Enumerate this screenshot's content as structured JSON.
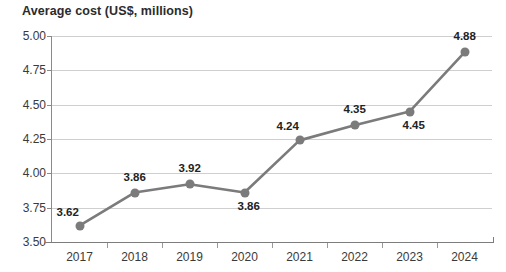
{
  "chart_data": {
    "type": "line",
    "title": "Average cost (US$, millions)",
    "xlabel": "",
    "ylabel": "",
    "categories": [
      "2017",
      "2018",
      "2019",
      "2020",
      "2021",
      "2022",
      "2023",
      "2024"
    ],
    "values": [
      3.62,
      3.86,
      3.92,
      3.86,
      4.24,
      4.35,
      4.45,
      4.88
    ],
    "point_labels": [
      "3.62",
      "3.86",
      "3.92",
      "3.86",
      "4.24",
      "4.35",
      "4.45",
      "4.88"
    ],
    "ylim": [
      3.5,
      5.0
    ],
    "ytick_labels": [
      "5.00",
      "4.75",
      "4.50",
      "4.25",
      "4.00",
      "3.75",
      "3.50"
    ],
    "ytick_values": [
      5.0,
      4.75,
      4.5,
      4.25,
      4.0,
      3.75,
      3.5
    ],
    "grid": true,
    "legend": "none",
    "series": [
      {
        "name": "Average cost (US$, millions)",
        "values": [
          3.62,
          3.86,
          3.92,
          3.86,
          4.24,
          4.35,
          4.45,
          4.88
        ],
        "color": "#7b7b7b"
      }
    ],
    "colors": {
      "line": "#7b7b7b",
      "marker": "#7b7b7b",
      "grid": "#cfcfcf",
      "axis": "#8a8a8a",
      "text": "#2b2b2b"
    },
    "label_positions": [
      "above-left",
      "above",
      "above",
      "below-right",
      "above-left",
      "above",
      "below-right",
      "above"
    ]
  }
}
